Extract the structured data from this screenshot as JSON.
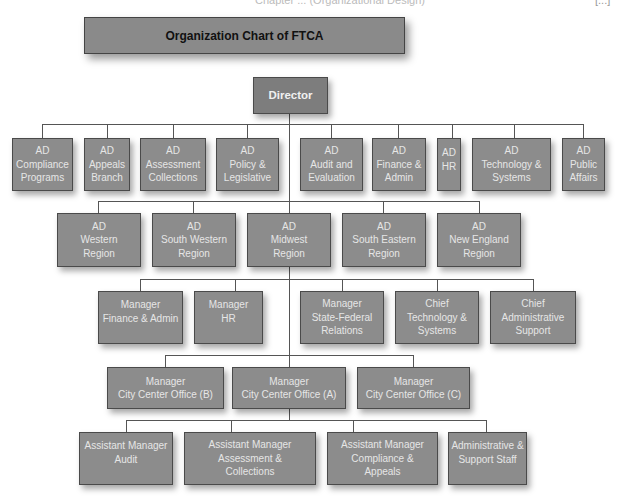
{
  "page_header": {
    "left_text": "Chapter ... (Organizational Design)",
    "right_text": "[...]"
  },
  "chart": {
    "title": "Organization Chart of FTCA",
    "director": "Director",
    "row1": [
      [
        "AD",
        "Compliance",
        "Programs"
      ],
      [
        "AD",
        "Appeals",
        "Branch"
      ],
      [
        "AD",
        "Assessment",
        "Collections"
      ],
      [
        "AD",
        "Policy &",
        "Legislative"
      ],
      [
        "AD",
        "Audit and",
        "Evaluation"
      ],
      [
        "AD",
        "Finance &",
        "Admin"
      ],
      [
        "AD",
        "HR",
        ""
      ],
      [
        "AD",
        "Technology &",
        "Systems"
      ],
      [
        "AD",
        "Public",
        "Affairs"
      ]
    ],
    "row2": [
      [
        "AD",
        "Western",
        "Region"
      ],
      [
        "AD",
        "South Western",
        "Region"
      ],
      [
        "AD",
        "Midwest",
        "Region"
      ],
      [
        "AD",
        "South Eastern",
        "Region"
      ],
      [
        "AD",
        "New  England",
        "Region"
      ]
    ],
    "row3": [
      [
        "Manager",
        "Finance & Admin",
        ""
      ],
      [
        "Manager",
        "HR",
        ""
      ],
      [
        "Manager",
        "State-Federal",
        "Relations"
      ],
      [
        "Chief",
        "Technology &",
        "Systems"
      ],
      [
        "Chief",
        "Administrative",
        "Support"
      ]
    ],
    "row4": [
      [
        "Manager",
        "City Center Office (B)"
      ],
      [
        "Manager",
        "City Center Office (A)"
      ],
      [
        "Manager",
        "City Center Office (C)"
      ]
    ],
    "row5": [
      [
        "Assistant Manager",
        "Audit",
        ""
      ],
      [
        "Assistant Manager",
        "Assessment &",
        "Collections"
      ],
      [
        "Assistant Manager",
        "Compliance &",
        "Appeals"
      ],
      [
        "Administrative &",
        "Support Staff",
        ""
      ]
    ]
  }
}
